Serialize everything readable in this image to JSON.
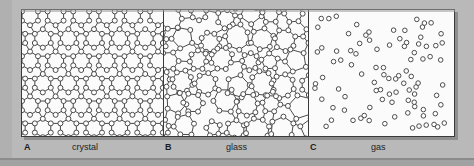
{
  "figure": {
    "background_color": "#b9b9b9",
    "panel_background": "#fbfbfb",
    "stroke_color": "#3a3a3a",
    "atom_fill": "#ffffff"
  },
  "captions": {
    "a_letter": "A",
    "a_label": "crystal",
    "b_letter": "B",
    "b_label": "glass",
    "c_letter": "C",
    "c_label": "gas"
  },
  "chart_data": {
    "type": "diagram",
    "panels": [
      {
        "id": "A",
        "name": "crystal",
        "description": "Ordered periodic network of hexagonal rings; every atom bonded, long-range order",
        "order": "long-range ordered",
        "bonded": true,
        "ring_sizes": [
          6
        ],
        "atom_count_approx": 96
      },
      {
        "id": "B",
        "name": "glass",
        "description": "Continuous random network; bonded atoms but irregular ring sizes, no long-range order",
        "order": "short-range order only",
        "bonded": true,
        "ring_sizes": [
          5,
          6,
          7,
          8
        ],
        "atom_count_approx": 92
      },
      {
        "id": "C",
        "name": "gas",
        "description": "Unbonded atoms dispersed randomly with no network",
        "order": "disordered",
        "bonded": false,
        "ring_sizes": [],
        "atom_count_approx": 84
      }
    ]
  }
}
